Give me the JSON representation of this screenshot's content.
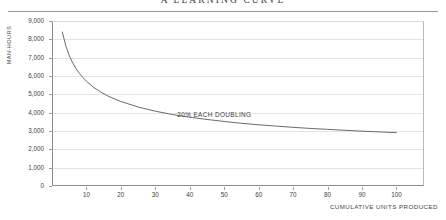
{
  "chart_data": {
    "type": "line",
    "title": "A LEARNING CURVE",
    "xlabel": "CUMULATIVE UNITS PRODUCED",
    "ylabel": "MAN-HOURS",
    "xlim": [
      0,
      108
    ],
    "ylim": [
      0,
      9000
    ],
    "grid": true,
    "legend": null,
    "annotations": [
      {
        "text": "20% EACH DOUBLING",
        "x": 50,
        "y": 3900
      }
    ],
    "yticks": [
      0,
      1000,
      2000,
      3000,
      4000,
      5000,
      6000,
      7000,
      8000,
      9000
    ],
    "ytick_labels": [
      "0",
      "1,000",
      "2,000",
      "3,000",
      "4,000",
      "5,000",
      "6,000",
      "7,000",
      "8,000",
      "9,000"
    ],
    "xticks": [
      10,
      20,
      30,
      40,
      50,
      60,
      70,
      80,
      90,
      100
    ],
    "xtick_labels": [
      "10",
      "20",
      "30",
      "40",
      "50",
      "60",
      "70",
      "80",
      "90",
      "100"
    ],
    "series": [
      {
        "name": "80% learning curve",
        "color": "#5a5a5a",
        "x": [
          3,
          4,
          5,
          6,
          7,
          8,
          9,
          10,
          12,
          14,
          16,
          18,
          20,
          25,
          30,
          35,
          40,
          45,
          50,
          55,
          60,
          65,
          70,
          75,
          80,
          85,
          90,
          95,
          100
        ],
        "y": [
          8400,
          7650,
          7120,
          6720,
          6400,
          6130,
          5910,
          5710,
          5390,
          5140,
          4930,
          4760,
          4610,
          4310,
          4080,
          3900,
          3750,
          3630,
          3520,
          3420,
          3340,
          3270,
          3200,
          3140,
          3090,
          3040,
          2990,
          2950,
          2910
        ]
      }
    ]
  }
}
